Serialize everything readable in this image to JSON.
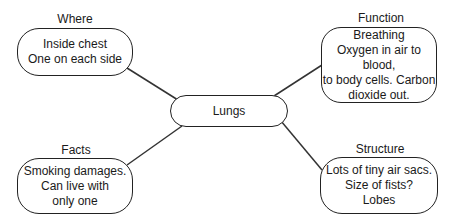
{
  "center": {
    "label": "Lungs"
  },
  "branches": [
    {
      "id": "where",
      "heading": "Where",
      "text": "Inside chest\nOne on each side"
    },
    {
      "id": "function",
      "heading": "Function",
      "text": "Breathing\nOxygen in air to blood,\nto body cells. Carbon\ndioxide out."
    },
    {
      "id": "facts",
      "heading": "Facts",
      "text": "Smoking damages.\nCan live with\nonly one"
    },
    {
      "id": "structure",
      "heading": "Structure",
      "text": "Lots of tiny air sacs.\nSize of fists?\nLobes"
    }
  ],
  "colors": {
    "stroke": "#222222",
    "background": "#ffffff"
  }
}
